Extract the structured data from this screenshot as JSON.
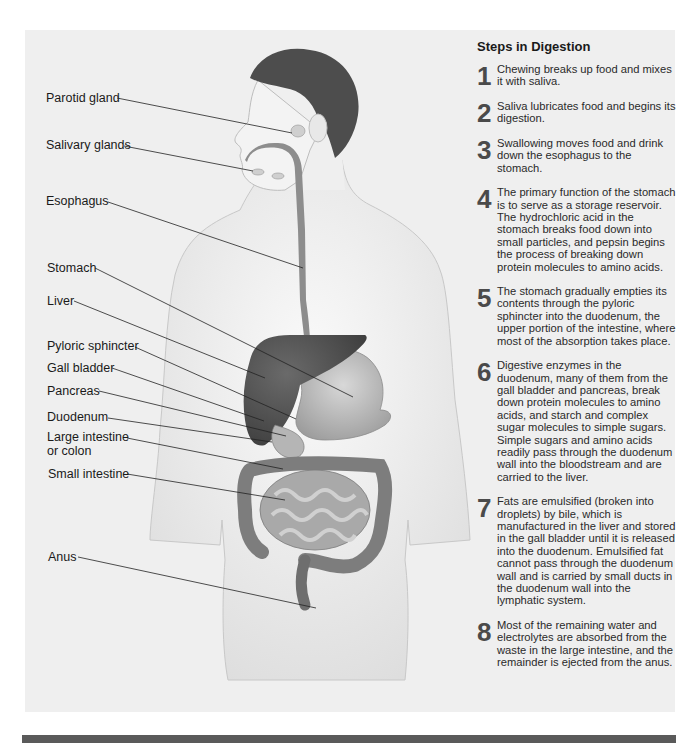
{
  "colors": {
    "panel_bg": "#efefef",
    "skin": "#f7f7f7",
    "hair": "#4a4a4a",
    "organ_light": "#bdbdbd",
    "organ_dark": "#5a5a5a",
    "liver": "#4d4d4d",
    "bar": "#5a5a5a"
  },
  "diagram": {
    "labels": [
      {
        "id": "parotid-gland",
        "text": "Parotid gland"
      },
      {
        "id": "salivary-glands",
        "text": "Salivary glands"
      },
      {
        "id": "esophagus",
        "text": "Esophagus"
      },
      {
        "id": "stomach",
        "text": "Stomach"
      },
      {
        "id": "liver",
        "text": "Liver"
      },
      {
        "id": "pyloric-sphincter",
        "text": "Pyloric sphincter"
      },
      {
        "id": "gall-bladder",
        "text": "Gall bladder"
      },
      {
        "id": "pancreas",
        "text": "Pancreas"
      },
      {
        "id": "duodenum",
        "text": "Duodenum"
      },
      {
        "id": "large-intestine",
        "text": "Large intestine"
      },
      {
        "id": "large-intestine-2",
        "text": "or colon"
      },
      {
        "id": "small-intestine",
        "text": "Small intestine"
      },
      {
        "id": "anus",
        "text": "Anus"
      }
    ]
  },
  "steps": {
    "title": "Steps in Digestion",
    "items": [
      {
        "num": "1",
        "text": "Chewing breaks up food and mixes it with saliva."
      },
      {
        "num": "2",
        "text": "Saliva lubricates food and begins its digestion."
      },
      {
        "num": "3",
        "text": "Swallowing moves food and drink down the esophagus to the stomach."
      },
      {
        "num": "4",
        "text": "The primary function of the stomach is to serve as a storage reservoir.  The hydrochloric acid in the stomach breaks food down into small particles, and pepsin begins the process of breaking down protein molecules to amino acids."
      },
      {
        "num": "5",
        "text": "The stomach gradually empties its contents through the pyloric sphincter into the duodenum, the upper portion of the intestine, where most of the absorption takes place."
      },
      {
        "num": "6",
        "text": "Digestive enzymes in the duodenum, many of them from the gall bladder and pancreas, break down protein molecules to amino acids, and starch and complex sugar molecules to simple sugars. Simple sugars and amino acids readily pass through the duodenum wall into the bloodstream and are carried to the liver."
      },
      {
        "num": "7",
        "text": "Fats are emulsified (broken into droplets) by bile, which is manufactured in the liver and stored in the gall bladder until it is released into the duodenum. Emulsified fat cannot pass through the duodenum wall and is carried by small ducts in the duodenum wall into the lymphatic system."
      },
      {
        "num": "8",
        "text": "Most of the remaining water and electrolytes are absorbed from the waste in the large intestine, and the remainder is ejected from the anus."
      }
    ]
  }
}
